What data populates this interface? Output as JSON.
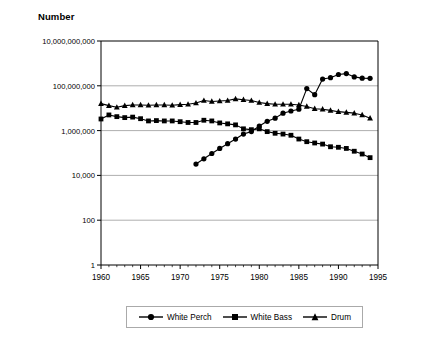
{
  "chart_data": {
    "type": "line",
    "title": "Number",
    "xlabel": "",
    "ylabel": "Number",
    "yscale": "log",
    "ylim": [
      1,
      10000000000
    ],
    "xlim": [
      1960,
      1995
    ],
    "grid": true,
    "legend_position": "bottom",
    "y_tick_labels": [
      "10,000,000,000",
      "100,000,000",
      "1,000,000",
      "10,000",
      "100",
      "1"
    ],
    "y_tick_values": [
      10000000000,
      100000000,
      1000000,
      10000,
      100,
      1
    ],
    "x_tick_labels": [
      "1960",
      "1965",
      "1970",
      "1975",
      "1980",
      "1985",
      "1990",
      "1995"
    ],
    "x_tick_values": [
      1960,
      1965,
      1970,
      1975,
      1980,
      1985,
      1990,
      1995
    ],
    "x_minor_tick_interval": 1,
    "series": [
      {
        "name": "White Perch",
        "marker": "circle",
        "color": "#000000",
        "x": [
          1972,
          1973,
          1974,
          1975,
          1976,
          1977,
          1978,
          1979,
          1980,
          1981,
          1982,
          1983,
          1984,
          1985,
          1986,
          1987,
          1988,
          1989,
          1990,
          1991,
          1992,
          1993,
          1994
        ],
        "values": [
          32000,
          55000,
          95000,
          160000,
          260000,
          420000,
          700000,
          900000,
          1600000,
          2600000,
          3600000,
          6000000,
          7500000,
          9000000,
          75000000,
          40000000,
          200000000,
          230000000,
          320000000,
          350000000,
          250000000,
          220000000,
          215000000
        ]
      },
      {
        "name": "White Bass",
        "marker": "square",
        "color": "#000000",
        "x": [
          1960,
          1961,
          1962,
          1963,
          1964,
          1965,
          1966,
          1967,
          1968,
          1969,
          1970,
          1971,
          1972,
          1973,
          1974,
          1975,
          1976,
          1977,
          1978,
          1979,
          1980,
          1981,
          1982,
          1983,
          1984,
          1985,
          1986,
          1987,
          1988,
          1989,
          1990,
          1991,
          1992,
          1993,
          1994
        ],
        "values": [
          3300000,
          5000000,
          4200000,
          3800000,
          4000000,
          3400000,
          2700000,
          2800000,
          2700000,
          2700000,
          2500000,
          2300000,
          2300000,
          2900000,
          2700000,
          2200000,
          2000000,
          1800000,
          1200000,
          1100000,
          1200000,
          900000,
          760000,
          700000,
          620000,
          420000,
          320000,
          280000,
          250000,
          190000,
          180000,
          160000,
          120000,
          90000,
          62000
        ]
      },
      {
        "name": "Drum",
        "marker": "triangle",
        "color": "#000000",
        "x": [
          1960,
          1961,
          1962,
          1963,
          1964,
          1965,
          1966,
          1967,
          1968,
          1969,
          1970,
          1971,
          1972,
          1973,
          1974,
          1975,
          1976,
          1977,
          1978,
          1979,
          1980,
          1981,
          1982,
          1983,
          1984,
          1985,
          1986,
          1987,
          1988,
          1989,
          1990,
          1991,
          1992,
          1993,
          1994
        ],
        "values": [
          16000000,
          13000000,
          11000000,
          13000000,
          14000000,
          14000000,
          13500000,
          14000000,
          14000000,
          13500000,
          14500000,
          15000000,
          17000000,
          22000000,
          20000000,
          21000000,
          22000000,
          26000000,
          24000000,
          22000000,
          18000000,
          16000000,
          15000000,
          15000000,
          15000000,
          14000000,
          12000000,
          9500000,
          9000000,
          8000000,
          7000000,
          6500000,
          6000000,
          5000000,
          3600000
        ]
      }
    ]
  },
  "legend": {
    "items": [
      {
        "label": "White Perch",
        "marker": "circle"
      },
      {
        "label": "White Bass",
        "marker": "square"
      },
      {
        "label": "Drum",
        "marker": "triangle"
      }
    ]
  }
}
